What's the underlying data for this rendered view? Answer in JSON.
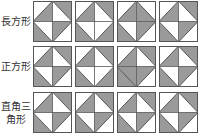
{
  "colors": {
    "shade": "#9a9a9a",
    "blank": "#ffffff",
    "stroke": "#555555"
  },
  "rows": [
    {
      "label_lines": [
        "長方形"
      ],
      "tiles": [
        {
          "outer": [
            "w",
            "g",
            "g",
            "w"
          ],
          "inner": [
            "g",
            "w",
            "w",
            "g"
          ]
        },
        {
          "outer": [
            "w",
            "g",
            "g",
            "g"
          ],
          "inner": [
            "g",
            "w",
            "w",
            "w"
          ]
        },
        {
          "outer": [
            "w",
            "w",
            "g",
            "w"
          ],
          "inner": [
            "g",
            "g",
            "w",
            "g"
          ]
        },
        {
          "outer": [
            "w",
            "g",
            "g",
            "w"
          ],
          "inner": [
            "g",
            "w",
            "w",
            "g"
          ]
        }
      ]
    },
    {
      "label_lines": [
        "正方形"
      ],
      "tiles": [
        {
          "outer": [
            "w",
            "g",
            "g",
            "w"
          ],
          "inner": [
            "g",
            "w",
            "w",
            "g"
          ]
        },
        {
          "outer": [
            "w",
            "g",
            "g",
            "g"
          ],
          "inner": [
            "g",
            "w",
            "w",
            "w"
          ]
        },
        {
          "outer": [
            "w",
            "g",
            "g",
            "w"
          ],
          "inner": [
            "g",
            "w",
            "g",
            "g"
          ]
        },
        {
          "outer": [
            "w",
            "g",
            "g",
            "w"
          ],
          "inner": [
            "g",
            "w",
            "w",
            "g"
          ]
        }
      ]
    },
    {
      "label_lines": [
        "直角三",
        "角形"
      ],
      "tiles": [
        {
          "outer": [
            "w",
            "g",
            "g",
            "w"
          ],
          "inner": [
            "g",
            "w",
            "w",
            "g"
          ]
        },
        {
          "outer": [
            "w",
            "g",
            "g",
            "w"
          ],
          "inner": [
            "g",
            "w",
            "w",
            "g"
          ]
        },
        {
          "outer": [
            "w",
            "g",
            "g",
            "w"
          ],
          "inner": [
            "g",
            "w",
            "w",
            "g"
          ]
        },
        {
          "outer": [
            "w",
            "g",
            "g",
            "w"
          ],
          "inner": [
            "g",
            "w",
            "w",
            "g"
          ]
        }
      ]
    }
  ]
}
